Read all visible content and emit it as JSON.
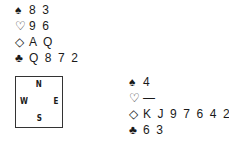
{
  "hands": {
    "north": {
      "spades": "8 3",
      "hearts": "9 6",
      "diamonds": "A Q",
      "clubs": "Q 8 7 2"
    },
    "east": {
      "spades": "4",
      "hearts": "—",
      "diamonds": "K J 9 7 6 4 2",
      "clubs": "6 3"
    }
  },
  "suits": {
    "spades": "♠",
    "hearts": "♡",
    "diamonds": "◇",
    "clubs": "♣"
  },
  "compass": {
    "north": "N",
    "west": "W",
    "east": "E",
    "south": "S"
  }
}
